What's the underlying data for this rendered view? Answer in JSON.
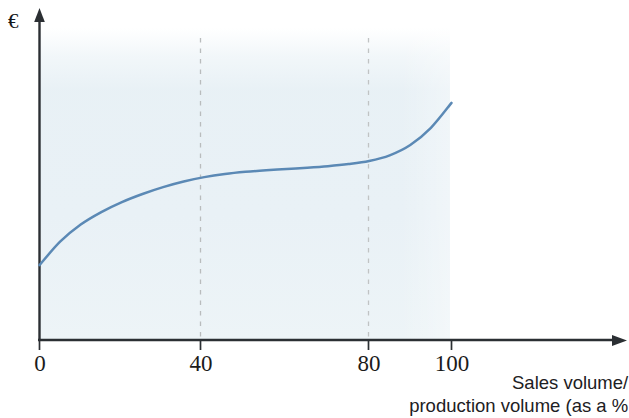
{
  "chart_data": {
    "type": "line",
    "title": "",
    "subtitle": "",
    "xlabel_lines": [
      "Sales volume/",
      "production volume (as a %"
    ],
    "xlabel": "Sales volume/production volume (as a %",
    "ylabel": "€",
    "ylabel_name": "euro-symbol",
    "x_ticks": [
      0,
      40,
      80,
      100
    ],
    "x_tick_labels": [
      "0",
      "40",
      "80",
      "100"
    ],
    "y_ticks": [],
    "y_tick_labels": [],
    "xlim": [
      0,
      143
    ],
    "ylim": [
      0,
      100
    ],
    "grid": "vertical-dashed",
    "gridlines_at": [
      40,
      80
    ],
    "legend": "none",
    "legend_position": "none",
    "series": [
      {
        "name": "Unit cost curve",
        "color": "#5b89b5",
        "x": [
          0,
          5,
          10,
          15,
          20,
          25,
          30,
          35,
          40,
          45,
          50,
          55,
          60,
          65,
          70,
          75,
          80,
          85,
          90,
          95,
          100
        ],
        "y": [
          24.0,
          31.5,
          37.0,
          41.0,
          44.2,
          46.8,
          49.0,
          50.8,
          52.2,
          53.2,
          53.9,
          54.4,
          54.8,
          55.2,
          55.7,
          56.4,
          57.4,
          59.2,
          62.5,
          68.0,
          76.0
        ]
      }
    ],
    "shaded_region": {
      "name": "plot-background-band",
      "x_from": 0,
      "x_to": 100,
      "color": "#e7f0f5"
    },
    "axis_color": "#2b2f33",
    "grid_color": "#b9bcbd"
  },
  "colors": {
    "curve": "#5b89b5",
    "axis": "#2b2f33",
    "grid": "#b9bcbd",
    "band": "#e7f0f5",
    "text": "#1b1b1b",
    "background": "#ffffff"
  },
  "ticks": {
    "t0": "0",
    "t40": "40",
    "t80": "80",
    "t100": "100"
  },
  "labels": {
    "y_axis_symbol": "€",
    "x_caption_line1": "Sales volume/",
    "x_caption_line2": "production volume (as a %"
  }
}
